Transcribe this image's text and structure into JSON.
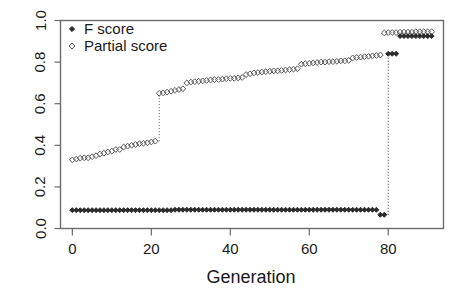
{
  "chart_data": {
    "type": "scatter",
    "title": "",
    "xlabel": "Generation",
    "ylabel": "",
    "xlim": [
      -3,
      94
    ],
    "ylim": [
      0.0,
      1.0
    ],
    "xticks": [
      0,
      20,
      40,
      60,
      80
    ],
    "yticks": [
      "0.0",
      "0.2",
      "0.4",
      "0.6",
      "0.8",
      "1.0"
    ],
    "ytick_values": [
      0.0,
      0.2,
      0.4,
      0.6,
      0.8,
      1.0
    ],
    "grid": false,
    "legend_position": "top-left",
    "legend": [
      {
        "label": "F score",
        "marker": "filled-diamond",
        "color": "#2b2b2b"
      },
      {
        "label": "Partial score",
        "marker": "open-diamond",
        "color": "#555555"
      }
    ],
    "series": [
      {
        "name": "F score",
        "marker": "filled-diamond",
        "color": "#2b2b2b",
        "x": [
          0,
          1,
          2,
          3,
          4,
          5,
          6,
          7,
          8,
          9,
          10,
          11,
          12,
          13,
          14,
          15,
          16,
          17,
          18,
          19,
          20,
          21,
          22,
          23,
          24,
          25,
          26,
          27,
          28,
          29,
          30,
          31,
          32,
          33,
          34,
          35,
          36,
          37,
          38,
          39,
          40,
          41,
          42,
          43,
          44,
          45,
          46,
          47,
          48,
          49,
          50,
          51,
          52,
          53,
          54,
          55,
          56,
          57,
          58,
          59,
          60,
          61,
          62,
          63,
          64,
          65,
          66,
          67,
          68,
          69,
          70,
          71,
          72,
          73,
          74,
          75,
          76,
          77,
          78,
          79,
          80,
          81,
          82,
          83,
          84,
          85,
          86,
          87,
          88,
          89,
          90,
          91
        ],
        "y": [
          0.088,
          0.088,
          0.088,
          0.088,
          0.088,
          0.088,
          0.088,
          0.088,
          0.088,
          0.088,
          0.088,
          0.088,
          0.088,
          0.088,
          0.088,
          0.088,
          0.088,
          0.088,
          0.088,
          0.088,
          0.088,
          0.088,
          0.088,
          0.088,
          0.088,
          0.088,
          0.09,
          0.09,
          0.09,
          0.09,
          0.09,
          0.09,
          0.09,
          0.09,
          0.09,
          0.09,
          0.09,
          0.09,
          0.09,
          0.09,
          0.09,
          0.09,
          0.09,
          0.09,
          0.09,
          0.09,
          0.09,
          0.09,
          0.09,
          0.09,
          0.09,
          0.09,
          0.09,
          0.09,
          0.09,
          0.09,
          0.09,
          0.09,
          0.09,
          0.09,
          0.09,
          0.09,
          0.09,
          0.09,
          0.09,
          0.09,
          0.09,
          0.09,
          0.09,
          0.09,
          0.09,
          0.09,
          0.09,
          0.09,
          0.09,
          0.09,
          0.09,
          0.09,
          0.066,
          0.066,
          0.84,
          0.84,
          0.84,
          0.925,
          0.925,
          0.925,
          0.925,
          0.925,
          0.925,
          0.925,
          0.925,
          0.925
        ]
      },
      {
        "name": "Partial score",
        "marker": "open-diamond",
        "color": "#555555",
        "x": [
          0,
          1,
          2,
          3,
          4,
          5,
          6,
          7,
          8,
          9,
          10,
          11,
          12,
          13,
          14,
          15,
          16,
          17,
          18,
          19,
          20,
          21,
          22,
          23,
          24,
          25,
          26,
          27,
          28,
          29,
          30,
          31,
          32,
          33,
          34,
          35,
          36,
          37,
          38,
          39,
          40,
          41,
          42,
          43,
          44,
          45,
          46,
          47,
          48,
          49,
          50,
          51,
          52,
          53,
          54,
          55,
          56,
          57,
          58,
          59,
          60,
          61,
          62,
          63,
          64,
          65,
          66,
          67,
          68,
          69,
          70,
          71,
          72,
          73,
          74,
          75,
          76,
          77,
          78,
          79,
          80,
          81,
          82,
          83,
          84,
          85,
          86,
          87,
          88,
          89,
          90,
          91
        ],
        "y": [
          0.33,
          0.334,
          0.338,
          0.34,
          0.34,
          0.345,
          0.35,
          0.358,
          0.362,
          0.368,
          0.372,
          0.38,
          0.38,
          0.392,
          0.396,
          0.4,
          0.404,
          0.408,
          0.41,
          0.412,
          0.416,
          0.42,
          0.65,
          0.652,
          0.656,
          0.66,
          0.664,
          0.668,
          0.672,
          0.7,
          0.704,
          0.706,
          0.708,
          0.71,
          0.712,
          0.714,
          0.716,
          0.716,
          0.718,
          0.72,
          0.722,
          0.722,
          0.724,
          0.726,
          0.74,
          0.744,
          0.748,
          0.75,
          0.752,
          0.754,
          0.756,
          0.758,
          0.758,
          0.76,
          0.762,
          0.764,
          0.766,
          0.768,
          0.79,
          0.792,
          0.794,
          0.796,
          0.798,
          0.8,
          0.8,
          0.802,
          0.802,
          0.804,
          0.806,
          0.806,
          0.808,
          0.82,
          0.822,
          0.824,
          0.826,
          0.828,
          0.83,
          0.832,
          0.834,
          0.94,
          0.942,
          0.942,
          0.942,
          0.944,
          0.944,
          0.944,
          0.944,
          0.946,
          0.946,
          0.946,
          0.946,
          0.946
        ]
      }
    ],
    "annotations": [
      {
        "text": "vertical dotted riser at generation ~79 for Partial score",
        "x": 79
      },
      {
        "text": "vertical dotted riser at generation ~80 for F score",
        "x": 80
      },
      {
        "text": "vertical dotted riser at generation ~22 for Partial score",
        "x": 22
      }
    ]
  },
  "axes": {
    "x_label": "Generation",
    "x_tick_labels": [
      "0",
      "20",
      "40",
      "60",
      "80"
    ],
    "y_tick_labels": [
      "0.0",
      "0.2",
      "0.4",
      "0.6",
      "0.8",
      "1.0"
    ]
  },
  "legend": {
    "items": [
      {
        "label": "F score",
        "icon": "filled-diamond-marker"
      },
      {
        "label": "Partial score",
        "icon": "open-diamond-marker"
      }
    ]
  },
  "style": {
    "frame_color": "#6b6b6b",
    "text_color": "#1a1a1a",
    "f_score_color": "#2b2b2b",
    "partial_score_color": "#555555",
    "background": "#ffffff"
  }
}
